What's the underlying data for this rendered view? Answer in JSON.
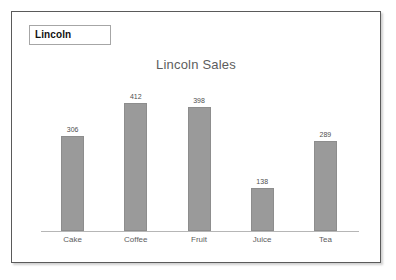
{
  "slide": {
    "legend_box_label": "Lincoln"
  },
  "chart_data": {
    "type": "bar",
    "title": "Lincoln Sales",
    "xlabel": "",
    "ylabel": "",
    "categories": [
      "Cake",
      "Coffee",
      "Fruit",
      "Juice",
      "Tea"
    ],
    "values": [
      306,
      412,
      398,
      138,
      289
    ],
    "value_labels": [
      "306",
      "412",
      "398",
      "138",
      "289"
    ],
    "ylim": [
      0,
      450
    ],
    "grid": false,
    "legend": "none",
    "bar_color": "#9a9a9a",
    "title_color": "#5d5d5d",
    "axis_color": "#b6b6b6"
  }
}
